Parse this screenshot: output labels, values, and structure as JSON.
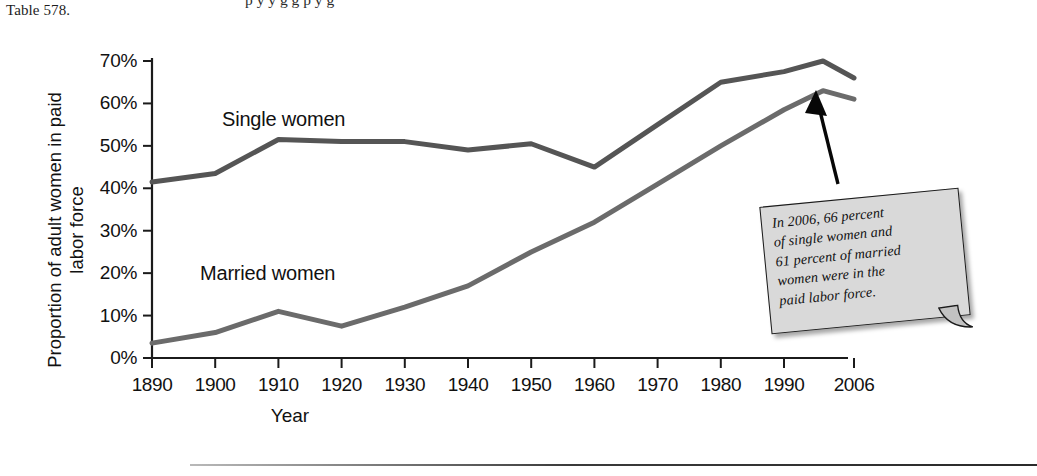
{
  "page": {
    "table_reference": "Table 578.",
    "clipped_top_line": "p                y                y       g g             p y               g"
  },
  "chart_data": {
    "type": "line",
    "title": "",
    "xlabel": "Year",
    "ylabel": "Proportion of adult women in paid labor force",
    "x_tick_labels": [
      "1890",
      "1900",
      "1910",
      "1920",
      "1930",
      "1940",
      "1950",
      "1960",
      "1970",
      "1980",
      "1990",
      "2006"
    ],
    "y_tick_labels": [
      "0%",
      "10%",
      "20%",
      "30%",
      "40%",
      "50%",
      "60%",
      "70%"
    ],
    "ylim": [
      0,
      70
    ],
    "grid": false,
    "legend_position": "inline-labels",
    "series": [
      {
        "name": "Single women",
        "color": "#555555",
        "x": [
          1890,
          1900,
          1910,
          1920,
          1930,
          1940,
          1950,
          1960,
          1970,
          1980,
          1990,
          1998,
          2006
        ],
        "values": [
          41.5,
          43.5,
          51.5,
          51.0,
          51.0,
          49.0,
          50.5,
          45.0,
          55.0,
          65.0,
          67.5,
          70.0,
          66.0
        ]
      },
      {
        "name": "Married women",
        "color": "#6b6b6b",
        "x": [
          1890,
          1900,
          1910,
          1920,
          1930,
          1940,
          1950,
          1960,
          1970,
          1980,
          1990,
          1998,
          2006
        ],
        "values": [
          3.5,
          6.0,
          11.0,
          7.5,
          12.0,
          17.0,
          25.0,
          32.0,
          41.0,
          50.0,
          58.5,
          63.0,
          61.0
        ]
      }
    ],
    "annotations": [
      {
        "name": "callout-note",
        "lines": [
          "In 2006, 66 percent",
          "of single women and",
          "61 percent of married",
          "women were in the",
          "paid labor force."
        ],
        "text": "In 2006, 66 percent of single women and 61 percent of married women were in the paid labor force.",
        "background": "#d9d9d9",
        "points_to": "2006 data points"
      }
    ]
  }
}
